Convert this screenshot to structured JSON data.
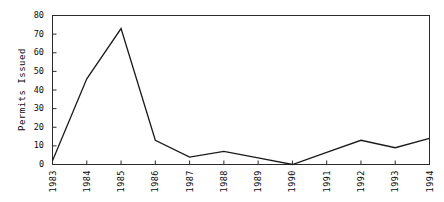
{
  "chart_data": {
    "type": "line",
    "title": "",
    "xlabel": "",
    "ylabel": "Permits Issued",
    "categories": [
      "1983",
      "1984",
      "1985",
      "1986",
      "1987",
      "1988",
      "1989",
      "1990",
      "1991",
      "1992",
      "1993",
      "1994"
    ],
    "values": [
      2,
      46,
      73,
      13,
      4,
      7,
      3.5,
      0,
      6.5,
      13,
      9,
      14
    ],
    "series": [
      {
        "name": "Permits Issued",
        "values": [
          2,
          46,
          73,
          13,
          4,
          7,
          3.5,
          0,
          6.5,
          13,
          9,
          14
        ]
      }
    ],
    "ylim": [
      0,
      80
    ],
    "yticks": [
      0,
      10,
      20,
      30,
      40,
      50,
      60,
      70,
      80
    ],
    "ytick_labels": [
      "0",
      "10",
      "20",
      "30",
      "40",
      "50",
      "60",
      "70",
      "80"
    ],
    "xtick_labels": [
      "1983",
      "1984",
      "1985",
      "1986",
      "1987",
      "1988",
      "1989",
      "1990",
      "1991",
      "1992",
      "1993",
      "1994"
    ],
    "grid": false,
    "legend": "none",
    "line_color": "#1a1a1a",
    "frame_color": "#2b2b2b",
    "background": "#ffffff"
  }
}
